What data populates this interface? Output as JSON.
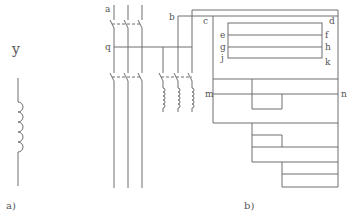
{
  "colors": {
    "line": "#6e6e6e",
    "text": "#555555",
    "background": "#ffffff"
  },
  "panel_a": {
    "caption": "a)",
    "symbol_label": "y",
    "element": "inductor-coil"
  },
  "panel_b": {
    "caption": "b)",
    "labels": {
      "a": "a",
      "q": "q",
      "b": "b",
      "c": "c",
      "d": "d",
      "e": "e",
      "f": "f",
      "g": "g",
      "h": "h",
      "j": "j",
      "k": "k",
      "m": "m",
      "n": "n"
    },
    "elements": [
      "three-phase-switch-upper",
      "three-phase-switch-lower",
      "three-phase-switch-with-coils",
      "bus-frame"
    ]
  }
}
